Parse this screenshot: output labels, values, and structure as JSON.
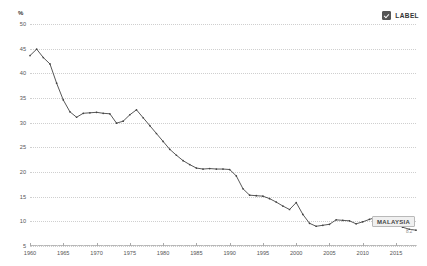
{
  "chart_data": {
    "type": "line",
    "title": "",
    "xlabel": "",
    "ylabel": "%",
    "unit_label": "%",
    "xlim": [
      1960,
      2018
    ],
    "ylim": [
      5,
      50
    ],
    "ytick_labels": [
      "5",
      "10",
      "15",
      "20",
      "25",
      "30",
      "35",
      "40",
      "45",
      "50"
    ],
    "ytick_values": [
      5,
      10,
      15,
      20,
      25,
      30,
      35,
      40,
      45,
      50
    ],
    "xtick_labels": [
      "1960",
      "1965",
      "1970",
      "1975",
      "1980",
      "1985",
      "1990",
      "1995",
      "2000",
      "2005",
      "2010",
      "2015"
    ],
    "xtick_values": [
      1960,
      1965,
      1970,
      1975,
      1980,
      1985,
      1990,
      1995,
      2000,
      2005,
      2010,
      2015
    ],
    "grid": true,
    "legend_position": "top-right",
    "series": [
      {
        "name": "MALAYSIA",
        "color": "#444444",
        "x": [
          1960,
          1961,
          1962,
          1963,
          1964,
          1965,
          1966,
          1967,
          1968,
          1969,
          1970,
          1971,
          1972,
          1973,
          1974,
          1975,
          1976,
          1977,
          1978,
          1979,
          1980,
          1981,
          1982,
          1983,
          1984,
          1985,
          1986,
          1987,
          1988,
          1989,
          1990,
          1991,
          1992,
          1993,
          1994,
          1995,
          1996,
          1997,
          1998,
          1999,
          2000,
          2001,
          2002,
          2003,
          2004,
          2005,
          2006,
          2007,
          2008,
          2009,
          2010,
          2011,
          2012,
          2013,
          2014,
          2015,
          2016,
          2017,
          2018
        ],
        "values": [
          43.6,
          44.9,
          43.2,
          41.9,
          38.0,
          34.6,
          32.2,
          31.1,
          31.9,
          32.0,
          32.1,
          31.9,
          31.8,
          29.9,
          30.3,
          31.6,
          32.6,
          31.0,
          29.4,
          27.8,
          26.2,
          24.6,
          23.4,
          22.3,
          21.5,
          20.8,
          20.6,
          20.7,
          20.6,
          20.6,
          20.5,
          19.2,
          16.6,
          15.3,
          15.2,
          15.1,
          14.6,
          13.9,
          13.1,
          12.4,
          13.8,
          11.4,
          9.6,
          9.0,
          9.2,
          9.4,
          10.3,
          10.2,
          10.1,
          9.5,
          9.9,
          10.4,
          10.8,
          10.2,
          9.7,
          9.4,
          8.8,
          8.4,
          8.2
        ]
      }
    ],
    "annotations": [
      {
        "name": "MALAYSIA",
        "label": "MALAYSIA",
        "value_label": "8.2",
        "x": 2018,
        "y": 8.2
      }
    ]
  },
  "legend": {
    "items": [
      {
        "label": "LABEL",
        "checked": true
      }
    ]
  }
}
